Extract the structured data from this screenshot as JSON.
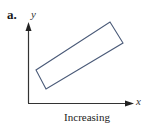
{
  "figure": {
    "part_label": "a.",
    "y_axis_label": "y",
    "x_axis_label": "x",
    "caption": "Increasing"
  },
  "colors": {
    "axis": "#333333",
    "rectangle": "#4a5a78",
    "text": "#222222"
  },
  "shapes": {
    "rectangle_corners": [
      [
        110,
        22
      ],
      [
        123,
        43
      ],
      [
        46,
        89
      ],
      [
        36,
        70
      ]
    ]
  }
}
